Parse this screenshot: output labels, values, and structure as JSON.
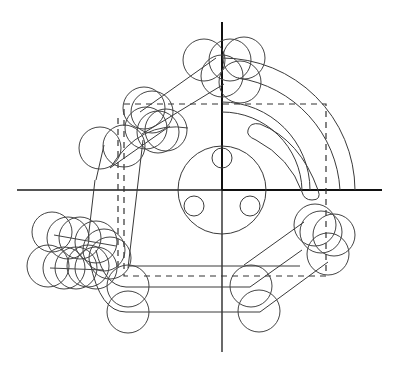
{
  "drawing": {
    "title": "",
    "colors": {
      "background": "#ffffff",
      "stroke": "#3a3a3a",
      "axis": "#111111"
    },
    "origin": {
      "x": 222,
      "y": 190
    },
    "axes": {
      "horizontal": {
        "x1": 17,
        "x2": 382,
        "y": 190
      },
      "vertical": {
        "x": 222,
        "y1": 22,
        "y2": 352
      }
    },
    "hub": {
      "cx": 222,
      "cy": 190,
      "r": 44,
      "holes": [
        {
          "cx": 222,
          "cy": 158,
          "r": 10
        },
        {
          "cx": 194,
          "cy": 206,
          "r": 10
        },
        {
          "cx": 250,
          "cy": 206,
          "r": 10
        }
      ]
    },
    "tool_circles_radius": 21
  }
}
